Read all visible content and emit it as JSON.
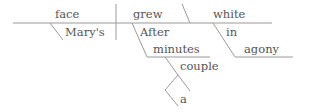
{
  "diagram": {
    "type": "sentence-diagram",
    "words": {
      "subject": "face",
      "verb": "grew",
      "complement": "white",
      "subject_modifier": "Mary's",
      "adverbial_preposition": "After",
      "adverbial_object": "minutes",
      "object_modifier": "couple",
      "article": "a",
      "preposition": "in",
      "prepositional_object": "agony"
    },
    "line_color": "#9a9a9a"
  }
}
